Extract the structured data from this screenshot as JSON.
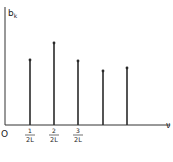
{
  "chart_data": {
    "type": "bar",
    "subtype": "stem",
    "title": "",
    "ylabel": "b",
    "ylabel_subscript": "k",
    "xlabel": "ν",
    "origin_label": "O",
    "x": [
      1,
      2,
      3,
      4,
      5
    ],
    "categories": [
      "1/2L",
      "2/2L",
      "3/2L",
      "",
      ""
    ],
    "tick_labels": [
      {
        "num": "1",
        "den": "2L"
      },
      {
        "num": "2",
        "den": "2L"
      },
      {
        "num": "3",
        "den": "2L"
      }
    ],
    "values": [
      65,
      82,
      64,
      54,
      57
    ],
    "ylim": [
      0,
      118
    ],
    "grid": false,
    "legend": null,
    "colors": {
      "stem": "#2a2a2a",
      "axis": "#333333"
    }
  },
  "layout": {
    "origin": [
      5,
      125
    ],
    "x_positions": [
      30,
      54,
      78,
      103,
      127
    ],
    "axis_x_end": 170,
    "axis_y_top": 7
  }
}
